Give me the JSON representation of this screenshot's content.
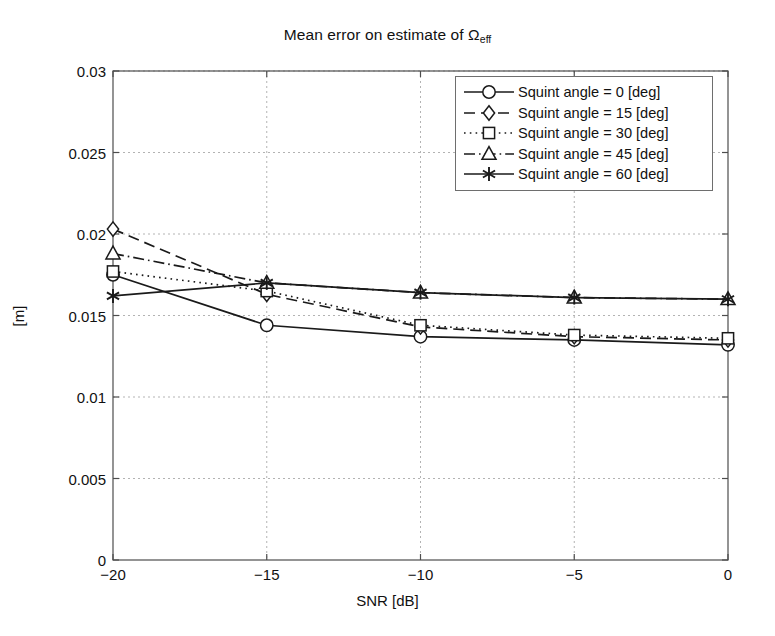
{
  "chart_data": {
    "type": "line",
    "title": "Mean error on estimate of Ωeff",
    "title_main": "Mean error on estimate of Ω",
    "title_sub": "eff",
    "xlabel": "SNR [dB]",
    "ylabel": "[m]",
    "xlim": [
      -20,
      0
    ],
    "ylim": [
      0,
      0.03
    ],
    "grid": true,
    "legend_position": "top-right",
    "x": [
      -20,
      -15,
      -10,
      -5,
      0
    ],
    "xticklabels": [
      "−20",
      "−15",
      "−10",
      "−5",
      "0"
    ],
    "yticks": [
      0,
      0.005,
      0.01,
      0.015,
      0.02,
      0.025,
      0.03
    ],
    "yticklabels": [
      "0",
      "0.005",
      "0.01",
      "0.015",
      "0.02",
      "0.025",
      "0.03"
    ],
    "series": [
      {
        "name": "Squint angle = 0 [deg]",
        "marker": "circle",
        "linestyle": "solid",
        "color": "#1a1a1a",
        "values": [
          0.0175,
          0.0144,
          0.0137,
          0.0135,
          0.0132
        ]
      },
      {
        "name": "Squint angle = 15 [deg]",
        "marker": "diamond",
        "linestyle": "dashed",
        "color": "#1a1a1a",
        "values": [
          0.0203,
          0.0163,
          0.0143,
          0.0137,
          0.0135
        ]
      },
      {
        "name": "Squint angle = 30 [deg]",
        "marker": "square",
        "linestyle": "dotted",
        "color": "#1a1a1a",
        "values": [
          0.0177,
          0.0165,
          0.0144,
          0.0138,
          0.0136
        ]
      },
      {
        "name": "Squint angle = 45 [deg]",
        "marker": "triangle",
        "linestyle": "dashdot",
        "color": "#1a1a1a",
        "values": [
          0.0188,
          0.017,
          0.0164,
          0.0161,
          0.016
        ]
      },
      {
        "name": "Squint angle = 60 [deg]",
        "marker": "asterisk",
        "linestyle": "solid",
        "color": "#1a1a1a",
        "values": [
          0.0162,
          0.017,
          0.0164,
          0.0161,
          0.016
        ]
      }
    ]
  },
  "colors": {
    "axis": "#4d4d4d",
    "grid": "#b3b3b3",
    "line": "#1a1a1a",
    "background": "#ffffff"
  }
}
